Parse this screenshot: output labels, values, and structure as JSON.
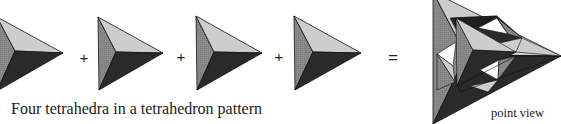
{
  "figure": {
    "caption": "Four tetrahedra in a tetrahedron pattern",
    "composite_label": "point view",
    "operators": [
      "+",
      "+",
      "+",
      "="
    ],
    "colors": {
      "light_face": "#c8c8c8",
      "mid_face": "#8a8a8a",
      "dark_face": "#2a2a2a",
      "edge": "#111111",
      "gap": "#ffffff"
    },
    "tetrahedra": [
      {
        "label": "tetrahedron-1"
      },
      {
        "label": "tetrahedron-2"
      },
      {
        "label": "tetrahedron-3"
      },
      {
        "label": "tetrahedron-4"
      }
    ]
  }
}
